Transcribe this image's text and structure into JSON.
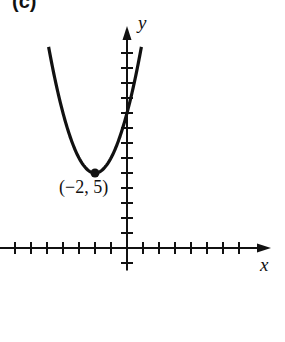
{
  "panel": {
    "label": "(c)"
  },
  "chart_data": {
    "type": "line",
    "title": "",
    "xlabel": "x",
    "ylabel": "y",
    "function": "y = (x + 2)^2 + 5",
    "vertex": {
      "x": -2,
      "y": 5,
      "label": "(−2, 5)"
    },
    "xlim": [
      -7.9,
      9.0
    ],
    "ylim": [
      -1.5,
      14.8
    ],
    "x_ticks": [
      -7,
      -6,
      -5,
      -4,
      -3,
      -2,
      -1,
      1,
      2,
      3,
      4,
      5,
      6,
      7
    ],
    "y_ticks": [
      -1,
      1,
      2,
      3,
      4,
      5,
      6,
      7,
      8,
      9,
      10,
      11,
      12,
      13
    ],
    "tick_labels_shown": false,
    "grid": false,
    "curve_domain": [
      -4.9,
      0.9
    ],
    "sample_points": [
      {
        "x": -4.9,
        "y": 13.41
      },
      {
        "x": -4,
        "y": 9
      },
      {
        "x": -3,
        "y": 6
      },
      {
        "x": -2,
        "y": 5
      },
      {
        "x": -1,
        "y": 6
      },
      {
        "x": 0,
        "y": 9
      },
      {
        "x": 0.9,
        "y": 13.41
      }
    ]
  },
  "style": {
    "ink": "#111111",
    "background": "#ffffff"
  }
}
